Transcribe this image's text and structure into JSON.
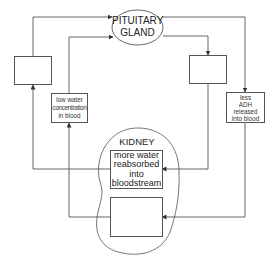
{
  "diagram": {
    "nodes": {
      "pituitary": {
        "label_line1": "PITUITARY",
        "label_line2": "GLAND"
      },
      "kidney": {
        "label": "KIDNEY"
      },
      "left_blank": {
        "label": ""
      },
      "low_water": {
        "line1": "low water",
        "line2": "concentration",
        "line3": "in blood"
      },
      "right_blank": {
        "label": ""
      },
      "less_adh": {
        "line1": "less",
        "line2": "ADH",
        "line3": "released",
        "line4": "into blood"
      },
      "more_water": {
        "line1": "more water",
        "line2": "reabsorbed",
        "line3": "into",
        "line4": "bloodstream"
      },
      "kidney_blank": {
        "label": ""
      }
    },
    "edges": [
      {
        "from": "left_blank",
        "to": "pituitary"
      },
      {
        "from": "low_water",
        "to": "pituitary"
      },
      {
        "from": "pituitary",
        "to": "right_blank"
      },
      {
        "from": "pituitary",
        "to": "less_adh"
      },
      {
        "from": "right_blank",
        "to": "more_water"
      },
      {
        "from": "less_adh",
        "to": "kidney_blank"
      },
      {
        "from": "more_water",
        "to": "left_blank"
      },
      {
        "from": "kidney_blank",
        "to": "low_water"
      }
    ],
    "colors": {
      "line": "#555555",
      "text": "#222222",
      "background": "#ffffff"
    }
  }
}
